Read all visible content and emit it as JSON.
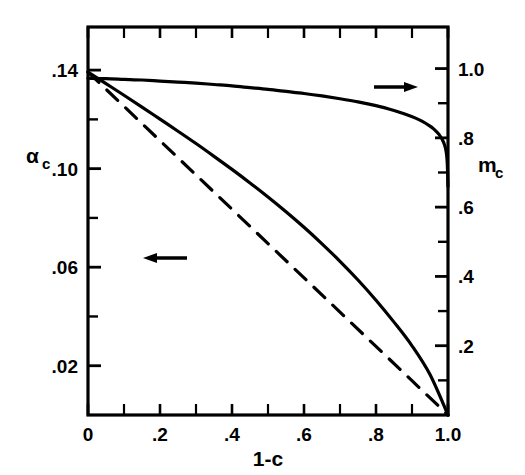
{
  "chart_data": {
    "type": "line",
    "title": "",
    "xlabel": "1-c",
    "ylabel_left": "αc",
    "ylabel_right": "mc",
    "grid": false,
    "legend_position": "none",
    "x_axis": {
      "label": "1-c",
      "min": 0,
      "max": 1.0,
      "major_ticks": [
        0,
        0.2,
        0.4,
        0.6,
        0.8,
        1.0
      ],
      "major_tick_labels": [
        "0",
        ".2",
        ".4",
        ".6",
        ".8",
        "1.0"
      ],
      "minor_tick_step": 0.1
    },
    "y_axis_left": {
      "label": "αc",
      "label_base": "α",
      "label_sub": "c",
      "min": 0,
      "max": 0.1575,
      "major_ticks": [
        0.02,
        0.06,
        0.1,
        0.14
      ],
      "major_tick_labels": [
        ".02",
        ".06",
        ".10",
        ".14"
      ],
      "minor_ticks": [
        0.04,
        0.08,
        0.12
      ]
    },
    "y_axis_right": {
      "label": "mc",
      "label_base": "m",
      "label_sub": "c",
      "min": 0,
      "max": 1.12,
      "major_ticks": [
        0.2,
        0.4,
        0.6,
        0.8,
        1.0
      ],
      "major_tick_labels": [
        ".2",
        ".4",
        ".6",
        ".8",
        "1.0"
      ],
      "minor_ticks": [
        0.1,
        0.3,
        0.5,
        0.7,
        0.9
      ]
    },
    "series": [
      {
        "name": "m_c",
        "axis": "right",
        "style": "solid",
        "color": "#000000",
        "annotation": "arrow-right",
        "x": [
          0.0,
          0.05,
          0.1,
          0.15,
          0.2,
          0.25,
          0.3,
          0.35,
          0.4,
          0.45,
          0.5,
          0.55,
          0.6,
          0.65,
          0.7,
          0.75,
          0.8,
          0.85,
          0.88,
          0.91,
          0.93,
          0.95,
          0.96,
          0.97,
          0.975,
          0.98,
          0.985,
          0.99,
          0.993,
          0.996,
          0.998,
          1.0
        ],
        "y": [
          0.972,
          0.971,
          0.969,
          0.967,
          0.964,
          0.961,
          0.958,
          0.954,
          0.95,
          0.945,
          0.94,
          0.934,
          0.928,
          0.921,
          0.913,
          0.904,
          0.893,
          0.879,
          0.869,
          0.857,
          0.847,
          0.834,
          0.826,
          0.816,
          0.81,
          0.802,
          0.793,
          0.781,
          0.77,
          0.752,
          0.726,
          0.66
        ]
      },
      {
        "name": "alpha_c solid",
        "axis": "left",
        "style": "solid",
        "color": "#000000",
        "annotation": "arrow-left",
        "x": [
          0.0,
          0.05,
          0.1,
          0.15,
          0.2,
          0.25,
          0.3,
          0.35,
          0.4,
          0.45,
          0.5,
          0.55,
          0.6,
          0.65,
          0.7,
          0.75,
          0.8,
          0.85,
          0.9,
          0.95,
          1.0
        ],
        "y": [
          0.1392,
          0.1345,
          0.1298,
          0.125,
          0.1201,
          0.1152,
          0.1102,
          0.105,
          0.0997,
          0.0942,
          0.0885,
          0.0825,
          0.0762,
          0.0695,
          0.0624,
          0.0548,
          0.0466,
          0.0377,
          0.0281,
          0.0164,
          0.0
        ]
      },
      {
        "name": "alpha_c dashed",
        "axis": "left",
        "style": "dashed",
        "color": "#000000",
        "annotation": "",
        "x": [
          0.0,
          1.0
        ],
        "y": [
          0.1392,
          0.0
        ]
      }
    ],
    "annotations": [
      {
        "name": "arrow-right",
        "text": "→",
        "points_to": "right-axis",
        "x": 0.8,
        "y_right": 0.93
      },
      {
        "name": "arrow-left",
        "text": "←",
        "points_to": "left-axis",
        "x": 0.165,
        "y_left": 0.0855
      }
    ]
  },
  "labels": {
    "x_title": "1-c",
    "left_title_base": "α",
    "left_title_sub": "c",
    "right_title_base": "m",
    "right_title_sub": "c",
    "x_ticks": [
      "0",
      ".2",
      ".4",
      ".6",
      ".8",
      "1.0"
    ],
    "y_left_ticks": [
      ".14",
      ".10",
      ".06",
      ".02"
    ],
    "y_right_ticks": [
      "1.0",
      ".8",
      ".6",
      ".4",
      ".2"
    ]
  },
  "colors": {
    "line": "#000000",
    "background": "#ffffff",
    "axis": "#000000"
  }
}
